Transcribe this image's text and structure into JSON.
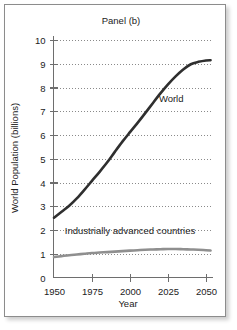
{
  "figure": {
    "title": "Panel (b)",
    "background_color": "#ffffff",
    "border_color": "#8c8c8c"
  },
  "chart_data": {
    "type": "line",
    "title": "Panel (b)",
    "xlabel": "Year",
    "ylabel": "World Population (billions)",
    "xlim": [
      1950,
      2055
    ],
    "ylim": [
      0,
      10.4
    ],
    "grid": true,
    "grid_style": "dotted-horizontal",
    "legend_position": "inline-annotation",
    "xticks": [
      1950,
      1975,
      2000,
      2025,
      2050
    ],
    "xtick_labels": [
      "1950",
      "1975",
      "2000",
      "2025",
      "2050"
    ],
    "yticks": [
      0,
      1,
      2,
      3,
      4,
      5,
      6,
      7,
      8,
      9,
      10
    ],
    "ytick_labels": [
      "0",
      "1",
      "2",
      "3",
      "4",
      "5",
      "6",
      "7",
      "8",
      "9",
      "10"
    ],
    "x": [
      1950,
      1955,
      1960,
      1965,
      1970,
      1975,
      1980,
      1985,
      1990,
      1995,
      2000,
      2005,
      2010,
      2015,
      2020,
      2025,
      2030,
      2035,
      2040,
      2045,
      2050,
      2053
    ],
    "series": [
      {
        "name": "World",
        "label": "World",
        "color": "#2f2f2f",
        "values": [
          2.52,
          2.77,
          3.02,
          3.33,
          3.69,
          4.07,
          4.45,
          4.85,
          5.29,
          5.72,
          6.12,
          6.51,
          6.92,
          7.34,
          7.75,
          8.13,
          8.47,
          8.76,
          8.98,
          9.08,
          9.14,
          9.15
        ]
      },
      {
        "name": "Industrially advanced countries",
        "label": "Industrially advanced countries",
        "color": "#8f8f8f",
        "values": [
          0.86,
          0.9,
          0.94,
          0.97,
          1.0,
          1.03,
          1.05,
          1.07,
          1.09,
          1.11,
          1.13,
          1.15,
          1.17,
          1.18,
          1.19,
          1.2,
          1.2,
          1.19,
          1.18,
          1.17,
          1.15,
          1.14
        ]
      }
    ],
    "annotations": [
      {
        "text": "World",
        "x": 2019,
        "y": 7.4
      },
      {
        "text": "Industrially advanced countries",
        "x": 2000,
        "y": 1.85
      }
    ]
  }
}
